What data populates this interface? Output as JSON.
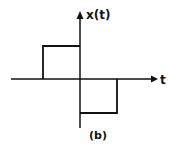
{
  "diagram": {
    "y_axis_label": "x(t)",
    "x_axis_label": "t",
    "caption": "(b)",
    "signal": {
      "description": "positive rectangular pulse for t<0 and negative rectangular pulse for t>0",
      "segments": [
        {
          "t_start": -1,
          "t_end": 0,
          "value": 1
        },
        {
          "t_start": 0,
          "t_end": 1,
          "value": -1
        }
      ]
    },
    "colors": {
      "stroke": "#111111",
      "background": "#ffffff"
    }
  }
}
